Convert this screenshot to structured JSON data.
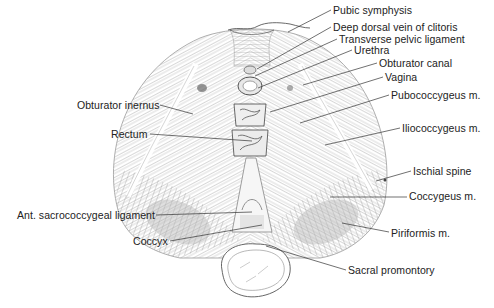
{
  "diagram": {
    "colors": {
      "ink": "#3a3a3a",
      "muscle": "#8a8a8a",
      "shade": "#bdbdbd",
      "background": "#ffffff"
    },
    "labels_right": [
      {
        "id": "pubic-symphysis",
        "text": "Pubic symphysis",
        "x": 333,
        "y": 4
      },
      {
        "id": "deep-dorsal-vein",
        "text": "Deep dorsal vein of clitoris",
        "x": 333,
        "y": 21
      },
      {
        "id": "transverse-pelvic-ligament",
        "text": "Transverse pelvic ligament",
        "x": 339,
        "y": 33
      },
      {
        "id": "urethra",
        "text": "Urethra",
        "x": 354,
        "y": 44
      },
      {
        "id": "obturator-canal",
        "text": "Obturator canal",
        "x": 379,
        "y": 57
      },
      {
        "id": "vagina",
        "text": "Vagina",
        "x": 385,
        "y": 71
      },
      {
        "id": "pubococcygeus",
        "text": "Pubococcygeus m.",
        "x": 391,
        "y": 89
      },
      {
        "id": "iliococcygeus",
        "text": "Iliococcygeus m.",
        "x": 402,
        "y": 122
      },
      {
        "id": "ischial-spine",
        "text": "Ischial spine",
        "x": 413,
        "y": 165
      },
      {
        "id": "coccygeus",
        "text": "Coccygeus m.",
        "x": 409,
        "y": 190
      },
      {
        "id": "piriformis",
        "text": "Piriformis m.",
        "x": 391,
        "y": 227
      },
      {
        "id": "sacral-promontory",
        "text": "Sacral promontory",
        "x": 348,
        "y": 264
      }
    ],
    "labels_left": [
      {
        "id": "obturator-inernus",
        "text": "Obturator inernus",
        "x": 77,
        "y": 99
      },
      {
        "id": "rectum",
        "text": "Rectum",
        "x": 111,
        "y": 128
      },
      {
        "id": "ant-sacrococcygeal-ligament",
        "text": "Ant. sacrococcygeal ligament",
        "x": 17,
        "y": 209
      },
      {
        "id": "coccyx",
        "text": "Coccyx",
        "x": 133,
        "y": 235
      }
    ]
  }
}
